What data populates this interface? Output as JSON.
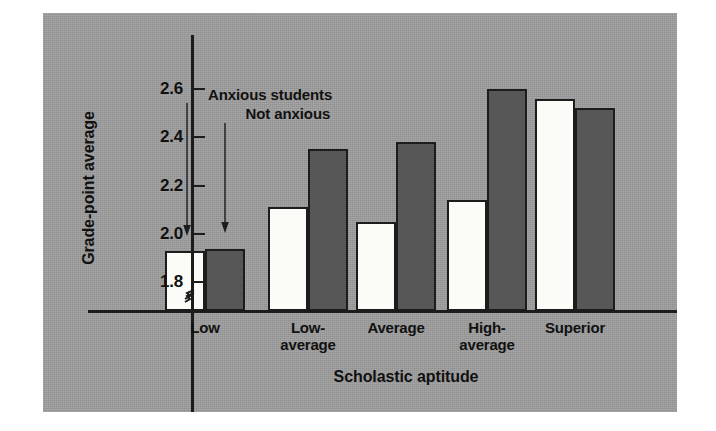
{
  "chart_data": {
    "type": "bar",
    "title": "",
    "xlabel": "Scholastic aptitude",
    "ylabel": "Grade-point average",
    "categories": [
      "Low",
      "Low-average",
      "Average",
      "High-average",
      "Superior"
    ],
    "category_lines": [
      [
        "Low"
      ],
      [
        "Low-",
        "average"
      ],
      [
        "Average"
      ],
      [
        "High-",
        "average"
      ],
      [
        "Superior"
      ]
    ],
    "series": [
      {
        "name": "Anxious students",
        "color": "#fbfbf7",
        "values": [
          1.93,
          2.11,
          2.05,
          2.14,
          2.56
        ]
      },
      {
        "name": "Not anxious",
        "color": "#575757",
        "values": [
          1.94,
          2.35,
          2.38,
          2.6,
          2.52
        ]
      }
    ],
    "ytick_labels": [
      "1.8",
      "2.0",
      "2.2",
      "2.4",
      "2.6"
    ],
    "yticks": [
      1.8,
      2.0,
      2.2,
      2.4,
      2.6
    ],
    "ylim": [
      1.74,
      2.68
    ],
    "axis_break": true,
    "grid": false,
    "legend_position": "inside-upper-left-with-leader-arrows"
  },
  "axis": {
    "ytick_0": "1.8",
    "ytick_1": "2.0",
    "ytick_2": "2.2",
    "ytick_3": "2.4",
    "ytick_4": "2.6",
    "ylabel": "Grade-point average",
    "xlabel": "Scholastic aptitude"
  },
  "legend": {
    "anxious": "Anxious students",
    "not_anxious": "Not anxious"
  },
  "categories": {
    "c0_l0": "Low",
    "c1_l0": "Low-",
    "c1_l1": "average",
    "c2_l0": "Average",
    "c3_l0": "High-",
    "c3_l1": "average",
    "c4_l0": "Superior"
  },
  "colors": {
    "panel": "#9d9d9d",
    "ink": "#1c1c1c",
    "anxious_bar": "#fbfbf7",
    "not_anxious_bar": "#575757"
  }
}
